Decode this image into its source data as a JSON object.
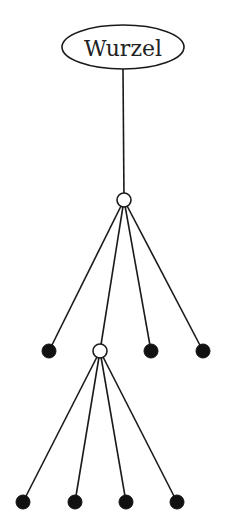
{
  "diagram": {
    "type": "tree",
    "root": {
      "label": "Wurzel",
      "cx": 123,
      "cy": 47,
      "rx": 61,
      "ry": 22
    },
    "nodes": [
      {
        "id": "n1",
        "kind": "open",
        "cx": 124,
        "cy": 200,
        "r": 7
      },
      {
        "id": "l1",
        "kind": "filled",
        "cx": 49,
        "cy": 351,
        "r": 7
      },
      {
        "id": "n2",
        "kind": "open",
        "cx": 100,
        "cy": 351,
        "r": 7
      },
      {
        "id": "l2",
        "kind": "filled",
        "cx": 151,
        "cy": 351,
        "r": 7
      },
      {
        "id": "l3",
        "kind": "filled",
        "cx": 203,
        "cy": 351,
        "r": 7
      },
      {
        "id": "l4",
        "kind": "filled",
        "cx": 23,
        "cy": 502,
        "r": 7
      },
      {
        "id": "l5",
        "kind": "filled",
        "cx": 75,
        "cy": 502,
        "r": 7
      },
      {
        "id": "l6",
        "kind": "filled",
        "cx": 126,
        "cy": 502,
        "r": 7
      },
      {
        "id": "l7",
        "kind": "filled",
        "cx": 177,
        "cy": 502,
        "r": 7
      }
    ],
    "edges": [
      {
        "from": "root",
        "to": "n1"
      },
      {
        "from": "n1",
        "to": "l1"
      },
      {
        "from": "n1",
        "to": "n2"
      },
      {
        "from": "n1",
        "to": "l2"
      },
      {
        "from": "n1",
        "to": "l3"
      },
      {
        "from": "n2",
        "to": "l4"
      },
      {
        "from": "n2",
        "to": "l5"
      },
      {
        "from": "n2",
        "to": "l6"
      },
      {
        "from": "n2",
        "to": "l7"
      }
    ]
  }
}
